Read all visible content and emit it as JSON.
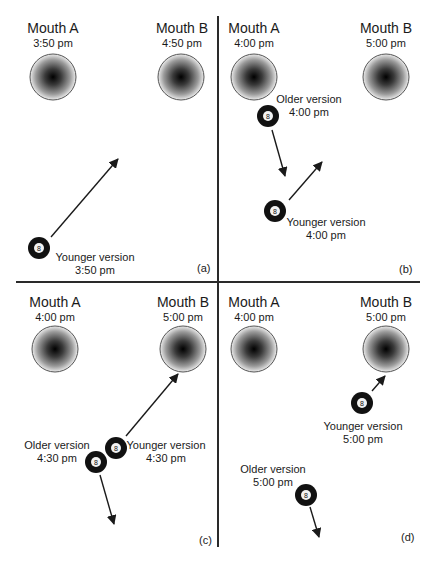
{
  "figure": {
    "colors": {
      "line": "#2a2a2a",
      "ball": "#111111",
      "mouth_edge": "#555555",
      "mouth_center": "#000000",
      "mouth_outer": "#e8e8e8"
    },
    "panels": [
      {
        "id": "a",
        "tag": "(a)",
        "mouth_a": {
          "name": "Mouth A",
          "time": "3:50 pm"
        },
        "mouth_b": {
          "name": "Mouth B",
          "time": "4:50 pm"
        },
        "balls": [
          {
            "label": "Younger version",
            "time": "3:50 pm",
            "number": "8"
          }
        ]
      },
      {
        "id": "b",
        "tag": "(b)",
        "mouth_a": {
          "name": "Mouth A",
          "time": "4:00 pm"
        },
        "mouth_b": {
          "name": "Mouth B",
          "time": "5:00 pm"
        },
        "balls": [
          {
            "label": "Older version",
            "time": "4:00 pm",
            "number": "8"
          },
          {
            "label": "Younger version",
            "time": "4:00 pm",
            "number": "8"
          }
        ]
      },
      {
        "id": "c",
        "tag": "(c)",
        "mouth_a": {
          "name": "Mouth A",
          "time": "4:00 pm"
        },
        "mouth_b": {
          "name": "Mouth B",
          "time": "5:00 pm"
        },
        "balls": [
          {
            "label": "Older version",
            "time": "4:30 pm",
            "number": "8"
          },
          {
            "label": "Younger version",
            "time": "4:30 pm",
            "number": "8"
          }
        ]
      },
      {
        "id": "d",
        "tag": "(d)",
        "mouth_a": {
          "name": "Mouth A",
          "time": "4:00 pm"
        },
        "mouth_b": {
          "name": "Mouth B",
          "time": "5:00 pm"
        },
        "balls": [
          {
            "label": "Younger version",
            "time": "5:00 pm",
            "number": "8"
          },
          {
            "label": "Older version",
            "time": "5:00 pm",
            "number": "8"
          }
        ]
      }
    ]
  }
}
